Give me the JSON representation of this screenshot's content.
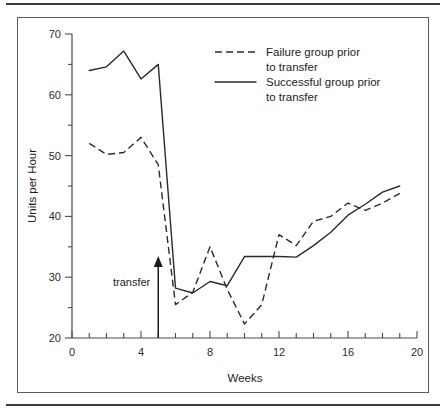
{
  "figure": {
    "has_top_rule": true,
    "has_bottom_rule": true,
    "border_color": "#5a5a5a",
    "background": "#ffffff"
  },
  "chart_data": {
    "type": "line",
    "title": "",
    "xlabel": "Weeks",
    "ylabel": "Units per Hour",
    "xlim": [
      0,
      20
    ],
    "ylim": [
      20,
      70
    ],
    "grid": false,
    "legend_position": "top-right",
    "x_major_ticks": [
      0,
      4,
      8,
      12,
      16,
      20
    ],
    "x_major_tick_labels": [
      "0",
      "4",
      "8",
      "12",
      "16",
      "20"
    ],
    "x_minor_ticks": [
      1,
      2,
      3,
      5,
      6,
      7,
      9,
      10,
      11,
      13,
      14,
      15,
      17,
      18,
      19
    ],
    "y_major_ticks": [
      20,
      30,
      40,
      50,
      60,
      70
    ],
    "y_major_tick_labels": [
      "20",
      "30",
      "40",
      "50",
      "60",
      "70"
    ],
    "y_minor_ticks": [
      25,
      35,
      45,
      55,
      65
    ],
    "x": [
      1,
      2,
      3,
      4,
      5,
      6,
      7,
      8,
      9,
      10,
      11,
      12,
      13,
      14,
      15,
      16,
      17,
      18,
      19
    ],
    "series": [
      {
        "name": "Failure group prior to transfer",
        "style": "dashed",
        "color": "#2b2b2b",
        "values": [
          52.0,
          50.2,
          50.5,
          53.0,
          48.5,
          25.5,
          27.5,
          35.0,
          28.0,
          22.3,
          25.5,
          37.0,
          35.2,
          39.2,
          40.0,
          42.2,
          41.0,
          42.2,
          43.8
        ]
      },
      {
        "name": "Successful group prior to transfer",
        "style": "solid",
        "color": "#2b2b2b",
        "values": [
          64.0,
          64.6,
          67.2,
          62.6,
          65.0,
          28.2,
          27.4,
          29.3,
          28.6,
          33.4,
          33.4,
          33.4,
          33.3,
          35.2,
          37.4,
          40.2,
          42.0,
          44.0,
          45.0
        ]
      }
    ],
    "annotations": [
      {
        "name": "transfer",
        "label": "transfer",
        "x": 5,
        "type": "up-arrow",
        "arrow_from_y": 20,
        "arrow_to_y": 33.5
      }
    ]
  },
  "legend": {
    "entries": [
      {
        "style": "dashed",
        "line1": "Failure group prior",
        "line2": "to transfer"
      },
      {
        "style": "solid",
        "line1": "Successful group prior",
        "line2": "to transfer"
      }
    ]
  }
}
